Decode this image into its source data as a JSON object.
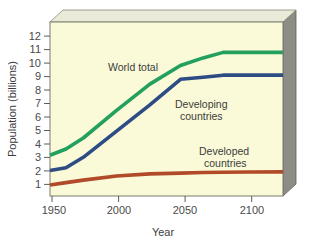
{
  "chart_data": {
    "type": "line",
    "title": "",
    "subtitle": "",
    "xlabel": "Year",
    "ylabel": "Population (billions)",
    "xlim": [
      1950,
      2125
    ],
    "ylim": [
      0,
      12.6
    ],
    "grid": false,
    "legend_position": "inline-annotations",
    "background_color": "#fafad8",
    "plot_frame_color": "#8f8f7e",
    "x_ticks": [
      1950,
      2000,
      2050,
      2100
    ],
    "x_tick_labels": [
      "1950",
      "2000",
      "2050",
      "2100"
    ],
    "y_ticks": [
      1,
      2,
      3,
      4,
      5,
      6,
      7,
      8,
      9,
      10,
      11,
      12
    ],
    "y_tick_labels": [
      "1",
      "2",
      "3",
      "4",
      "5",
      "6",
      "7",
      "8",
      "9",
      "10",
      "11",
      "12"
    ],
    "series": [
      {
        "name": "World total",
        "color": "#23a05e",
        "x": [
          1950,
          1962,
          1975,
          2000,
          2025,
          2048,
          2065,
          2080,
          2100,
          2125
        ],
        "values": [
          2.95,
          3.4,
          4.2,
          6.2,
          8.1,
          9.45,
          10.0,
          10.4,
          10.4,
          10.4
        ]
      },
      {
        "name": "Developing countries",
        "color": "#2d4c84",
        "x": [
          1950,
          1962,
          1975,
          2000,
          2025,
          2048,
          2065,
          2080,
          2100,
          2125
        ],
        "values": [
          1.85,
          2.05,
          2.8,
          4.7,
          6.6,
          8.45,
          8.6,
          8.75,
          8.75,
          8.75
        ]
      },
      {
        "name": "Developed countries",
        "color": "#b04a28",
        "x": [
          1950,
          1962,
          1975,
          2000,
          2025,
          2048,
          2065,
          2080,
          2100,
          2125
        ],
        "values": [
          0.8,
          0.97,
          1.15,
          1.45,
          1.6,
          1.66,
          1.7,
          1.72,
          1.74,
          1.75
        ]
      }
    ],
    "annotations": [
      {
        "text": "World total",
        "series": "World total"
      },
      {
        "text": "Developing",
        "series": "Developing countries"
      },
      {
        "text": "countries",
        "series": "Developing countries"
      },
      {
        "text": "Developed",
        "series": "Developed countries"
      },
      {
        "text": "countries",
        "series": "Developed countries"
      }
    ]
  },
  "labels": {
    "y_axis_title": "Population (billions)",
    "x_axis_title": "Year",
    "world_total": "World total",
    "developing_line1": "Developing",
    "developing_line2": "countries",
    "developed_line1": "Developed",
    "developed_line2": "countries",
    "y_12": "12",
    "y_11": "11",
    "y_10": "10",
    "y_9": "9",
    "y_8": "8",
    "y_7": "7",
    "y_6": "6",
    "y_5": "5",
    "y_4": "4",
    "y_3": "3",
    "y_2": "2",
    "y_1": "1",
    "x_1950": "1950",
    "x_2000": "2000",
    "x_2050": "2050",
    "x_2100": "2100"
  },
  "colors": {
    "plot_background": "#fafad8",
    "slab_side": "#8d8d86",
    "slab_top": "#e9e9d8",
    "frame_line": "#6e6e60",
    "world_total": "#23a05e",
    "developing": "#2d4c84",
    "developed": "#b04a28",
    "tick_text": "#4a4a4a"
  }
}
